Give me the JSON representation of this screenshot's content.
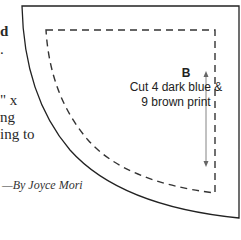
{
  "left_text_fragments": [
    {
      "text": "d",
      "top": 24
    },
    {
      "text": ".",
      "top": 42
    },
    {
      "text": "\" x",
      "top": 93
    },
    {
      "text": "ng",
      "top": 110
    },
    {
      "text": "ing to",
      "top": 127
    }
  ],
  "pattern_piece": {
    "label": "B",
    "instruction_line1": "Cut 4 dark blue &",
    "instruction_line2": "9 brown print",
    "grain_arrow": "bidirectional-vertical"
  },
  "credit": "—By Joyce Mori"
}
